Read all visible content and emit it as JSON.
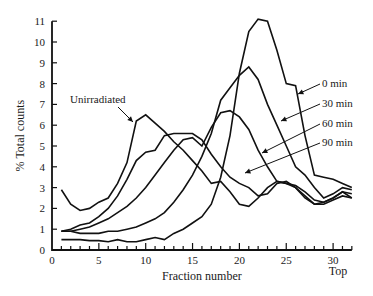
{
  "chart_data": {
    "type": "line",
    "title": "",
    "xlabel": "Fraction number",
    "ylabel": "% Total counts",
    "x_end_label": "Top",
    "xlim": [
      0,
      32
    ],
    "ylim": [
      0,
      11
    ],
    "x_ticks": [
      0,
      5,
      10,
      15,
      20,
      25,
      30
    ],
    "y_ticks": [
      0,
      1,
      2,
      3,
      4,
      5,
      6,
      7,
      8,
      9,
      10,
      11
    ],
    "grid": false,
    "x": [
      1,
      2,
      3,
      4,
      5,
      6,
      7,
      8,
      9,
      10,
      11,
      12,
      13,
      14,
      15,
      16,
      17,
      18,
      19,
      20,
      21,
      22,
      23,
      24,
      25,
      26,
      27,
      28,
      29,
      30,
      31,
      32
    ],
    "series": [
      {
        "name": "Unirradiated",
        "values": [
          2.9,
          2.2,
          1.9,
          2.0,
          2.3,
          2.5,
          3.2,
          4.2,
          6.2,
          6.5,
          6.1,
          5.7,
          5.2,
          4.8,
          4.3,
          3.8,
          3.2,
          3.3,
          2.8,
          2.2,
          2.1,
          2.5,
          3.0,
          3.3,
          3.2,
          3.0,
          2.5,
          2.2,
          2.3,
          2.5,
          2.8,
          2.5
        ]
      },
      {
        "name": "90 min",
        "values": [
          0.9,
          1.0,
          1.2,
          1.3,
          1.6,
          2.0,
          2.6,
          3.4,
          4.3,
          4.7,
          4.8,
          5.5,
          5.6,
          5.6,
          5.6,
          5.3,
          4.6,
          4.0,
          3.5,
          3.2,
          3.0,
          2.6,
          2.7,
          3.2,
          3.3,
          3.0,
          2.6,
          2.2,
          2.2,
          2.4,
          2.6,
          2.5
        ]
      },
      {
        "name": "60 min",
        "values": [
          0.9,
          0.9,
          1.0,
          1.1,
          1.3,
          1.5,
          1.8,
          2.1,
          2.5,
          3.0,
          3.6,
          4.2,
          4.8,
          5.3,
          5.4,
          5.0,
          5.9,
          6.6,
          6.7,
          6.4,
          5.8,
          4.8,
          4.0,
          3.3,
          3.2,
          3.1,
          2.8,
          2.4,
          2.3,
          2.5,
          2.8,
          2.7
        ]
      },
      {
        "name": "30 min",
        "values": [
          0.9,
          0.9,
          0.8,
          0.8,
          0.8,
          0.9,
          0.9,
          1.0,
          1.1,
          1.3,
          1.5,
          1.8,
          2.3,
          2.9,
          3.6,
          4.5,
          5.6,
          7.2,
          7.8,
          8.4,
          8.8,
          8.2,
          7.0,
          6.0,
          5.0,
          4.0,
          3.6,
          3.0,
          2.5,
          2.7,
          3.0,
          2.9
        ]
      },
      {
        "name": "0 min",
        "values": [
          0.5,
          0.5,
          0.5,
          0.45,
          0.45,
          0.4,
          0.5,
          0.4,
          0.4,
          0.5,
          0.6,
          0.5,
          0.8,
          1.0,
          1.3,
          1.6,
          2.2,
          3.5,
          5.5,
          8.5,
          10.5,
          11.1,
          11.0,
          9.6,
          8.0,
          7.9,
          5.5,
          3.6,
          3.5,
          3.4,
          3.2,
          3.0
        ]
      }
    ],
    "annotations": [
      {
        "label": "Unirradiated",
        "points_to_fraction": 9
      },
      {
        "label": "0 min",
        "points_to_fraction": 26
      },
      {
        "label": "30 min",
        "points_to_fraction": 22.5
      },
      {
        "label": "60 min",
        "points_to_fraction": 19.5
      },
      {
        "label": "90 min",
        "points_to_fraction": 19
      }
    ],
    "legend": "inline arrows (right side)"
  }
}
